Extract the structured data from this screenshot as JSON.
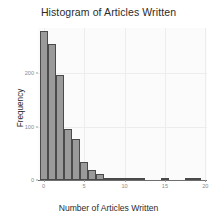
{
  "chart_data": {
    "type": "bar",
    "title": "Histogram of Articles Written",
    "xlabel": "Number of Articles Written",
    "ylabel": "Frequency",
    "categories": [
      0,
      1,
      2,
      3,
      4,
      5,
      6,
      7,
      8,
      9,
      10,
      11,
      12,
      13,
      14,
      15,
      16,
      17,
      18,
      19
    ],
    "values": [
      280,
      255,
      196,
      96,
      76,
      33,
      19,
      11,
      3,
      2,
      2,
      1,
      3,
      0,
      0,
      1,
      0,
      0,
      1,
      1
    ],
    "bin_width": 1,
    "xlim": [
      -0.7,
      20.2
    ],
    "ylim": [
      0,
      285
    ],
    "xticks": [
      0,
      5,
      10,
      15,
      20
    ],
    "xtick_labels": [
      "0",
      "5",
      "10",
      "15",
      "20"
    ],
    "yticks": [
      0,
      100,
      200
    ],
    "ytick_labels": [
      "0",
      "100",
      "200"
    ],
    "grid": true,
    "legend": false,
    "bar_color": "#9a9a9a",
    "bar_edge_color": "#4a4a4a",
    "panel_background": "#fbfbfb",
    "grid_color": "#ededed",
    "axis_color": "#6e6e6e",
    "tick_label_color": "#8a8a8a",
    "text_color": "#2b2b2b"
  }
}
